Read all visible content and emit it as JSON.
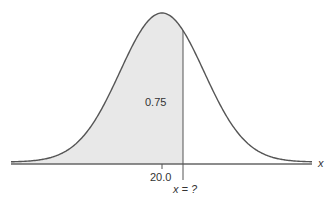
{
  "chart_data": {
    "type": "area",
    "title": "",
    "mean": 20.0,
    "shaded_area": 0.75,
    "shaded_region": "left of x = ?",
    "xlabel": "x",
    "ylabel": "",
    "tick_labels": [
      "20.0"
    ],
    "annotations": [
      "0.75",
      "x = ?"
    ],
    "grid": false,
    "legend": null
  },
  "labels": {
    "area": "0.75",
    "mean": "20.0",
    "unknown": "x = ?",
    "axis": "x"
  },
  "colors": {
    "curve": "#555555",
    "fill": "#e8e8e8",
    "axis": "#555555",
    "text": "#333333"
  },
  "geometry": {
    "mean_px": 162,
    "sigma_px": 42,
    "baseline_y": 162,
    "peak_y": 13,
    "cut_px": 183,
    "axis_x0": 11,
    "axis_x1": 312
  }
}
